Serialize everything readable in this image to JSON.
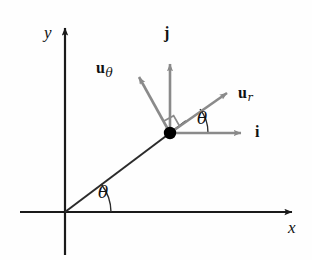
{
  "figure": {
    "background_color": "#fefefe",
    "axis_color": "#1a1a1a",
    "vector_color": "#8a8a8a",
    "radial_line_color": "#2b2b2b",
    "point_color": "#000000",
    "text_color": "#111111",
    "width": 312,
    "height": 260
  },
  "axes": {
    "x_label": "x",
    "y_label": "y",
    "origin": {
      "x": 65,
      "y": 212
    },
    "x_axis": {
      "x1": 20,
      "y1": 212,
      "x2": 298,
      "y2": 212
    },
    "y_axis": {
      "x1": 65,
      "y1": 255,
      "x2": 65,
      "y2": 22
    }
  },
  "point": {
    "name": "particle-point",
    "x": 170,
    "y": 133,
    "radius": 6
  },
  "radial_line": {
    "from": {
      "x": 65,
      "y": 212
    },
    "to": {
      "x": 186,
      "y": 121
    }
  },
  "vectors": [
    {
      "id": "j",
      "label": "j",
      "subscript": "",
      "tip": {
        "x": 170,
        "y": 57
      },
      "label_pos": {
        "x": 163,
        "y": 26
      }
    },
    {
      "id": "i",
      "label": "i",
      "subscript": "",
      "tip": {
        "x": 248,
        "y": 133
      },
      "label_pos": {
        "x": 255,
        "y": 124
      }
    },
    {
      "id": "u_r",
      "label": "u",
      "subscript": "r",
      "tip": {
        "x": 232,
        "y": 88
      },
      "label_pos": {
        "x": 238,
        "y": 85
      }
    },
    {
      "id": "u_theta",
      "label": "u",
      "subscript": "θ",
      "tip": {
        "x": 133,
        "y": 72
      },
      "label_pos": {
        "x": 97,
        "y": 60
      }
    }
  ],
  "angles": [
    {
      "id": "theta-origin",
      "label": "θ",
      "label_pos": {
        "x": 100,
        "y": 185
      },
      "vertex": {
        "x": 65,
        "y": 212
      },
      "radius": 46,
      "start_deg": 0,
      "end_deg": 37
    },
    {
      "id": "theta-point",
      "label": "θ",
      "label_pos": {
        "x": 198,
        "y": 110
      },
      "vertex": {
        "x": 170,
        "y": 133
      },
      "radius": 38,
      "start_deg": 0,
      "end_deg": 37
    }
  ],
  "right_angle_marker": {
    "id": "right-angle-ur-utheta",
    "vertex": {
      "x": 170,
      "y": 133
    },
    "size": 13
  }
}
